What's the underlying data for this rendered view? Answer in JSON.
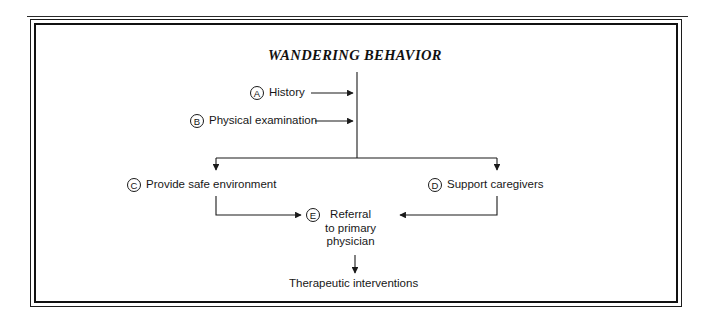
{
  "figure": {
    "title": "WANDERING BEHAVIOR",
    "nodes": [
      {
        "marker": "A",
        "label": "History"
      },
      {
        "marker": "B",
        "label": "Physical examination"
      },
      {
        "marker": "C",
        "label": "Provide safe environment"
      },
      {
        "marker": "D",
        "label": "Support caregivers"
      },
      {
        "marker": "E",
        "label": "Referral\nto primary\nphysician"
      }
    ],
    "terminal": "Therapeutic interventions",
    "colors": {
      "ink": "#171717",
      "line": "#1a1a1a",
      "frame": "#111111",
      "background": "#ffffff"
    }
  }
}
